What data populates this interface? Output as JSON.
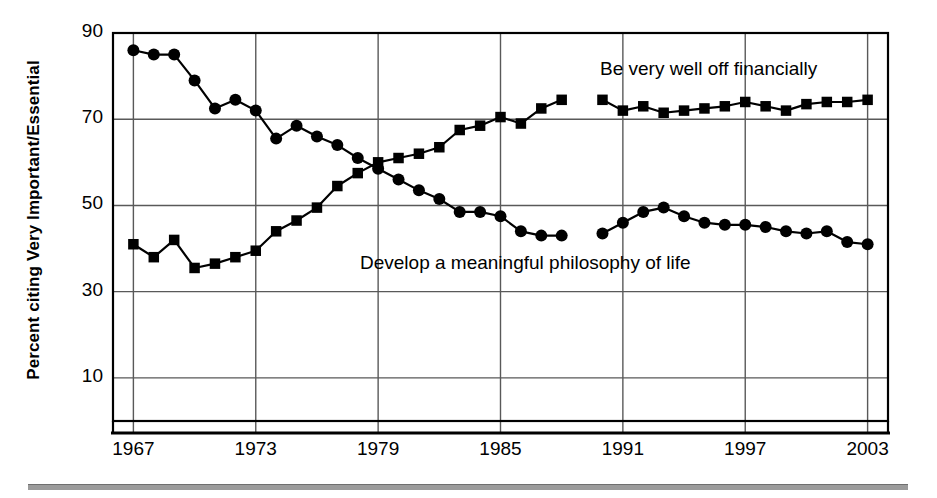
{
  "chart_data": {
    "type": "line",
    "title": "",
    "subtitle": "",
    "xlabel": "",
    "ylabel": "Percent citing Very Important/Essential",
    "xlim": [
      1966,
      2004
    ],
    "ylim": [
      0,
      90
    ],
    "xticks": [
      "1967",
      "1973",
      "1979",
      "1985",
      "1991",
      "1997",
      "2003"
    ],
    "xtick_values": [
      1967,
      1973,
      1979,
      1985,
      1991,
      1997,
      2003
    ],
    "yticks": [
      "10",
      "30",
      "50",
      "70",
      "90"
    ],
    "ytick_values": [
      10,
      30,
      50,
      70,
      90
    ],
    "grid": true,
    "legend_position": "inline-annotations",
    "x": [
      1967,
      1968,
      1969,
      1970,
      1971,
      1972,
      1973,
      1974,
      1975,
      1976,
      1977,
      1978,
      1979,
      1980,
      1981,
      1982,
      1983,
      1984,
      1985,
      1986,
      1987,
      1988,
      1989,
      1990,
      1991,
      1992,
      1993,
      1994,
      1995,
      1996,
      1997,
      1998,
      1999,
      2000,
      2001,
      2002,
      2003
    ],
    "series": [
      {
        "name": "Be very well off financially",
        "marker": "square",
        "color": "#000000",
        "values": [
          41.0,
          38.0,
          42.0,
          35.5,
          36.5,
          38.0,
          39.5,
          44.0,
          46.5,
          49.5,
          54.5,
          57.5,
          60.0,
          61.0,
          62.0,
          63.5,
          67.5,
          68.5,
          70.5,
          69.0,
          72.5,
          74.5,
          null,
          74.5,
          72.0,
          73.0,
          71.5,
          72.0,
          72.5,
          73.0,
          74.0,
          73.0,
          72.0,
          73.5,
          74.0,
          74.0,
          74.5
        ]
      },
      {
        "name": "Develop a meaningful philosophy of life",
        "marker": "circle",
        "color": "#000000",
        "values": [
          86.0,
          85.0,
          85.0,
          79.0,
          72.5,
          74.5,
          72.0,
          65.5,
          68.5,
          66.0,
          64.0,
          61.0,
          58.5,
          56.0,
          53.5,
          51.5,
          48.5,
          48.5,
          47.5,
          44.0,
          43.0,
          43.0,
          null,
          43.5,
          46.0,
          48.5,
          49.5,
          47.5,
          46.0,
          45.5,
          45.5,
          45.0,
          44.0,
          43.5,
          44.0,
          41.5,
          41.0
        ]
      }
    ],
    "annotations": [
      {
        "text": "Be very well off financially",
        "x": 1991,
        "y": 82
      },
      {
        "text": "Develop a meaningful philosophy of life",
        "x": 1982,
        "y": 35
      }
    ]
  },
  "axis": {
    "ylabel": "Percent citing Very Important/Essential",
    "ytick_labels": [
      "90",
      "70",
      "50",
      "30",
      "10"
    ],
    "xtick_labels": [
      "1967",
      "1973",
      "1979",
      "1985",
      "1991",
      "1997",
      "2003"
    ]
  },
  "labels": {
    "finance": "Be very well off financially",
    "philosophy": "Develop a meaningful philosophy of life"
  },
  "colors": {
    "ink": "#000000",
    "grid": "#595959",
    "rule": "#9b9b9b",
    "background": "#ffffff"
  }
}
